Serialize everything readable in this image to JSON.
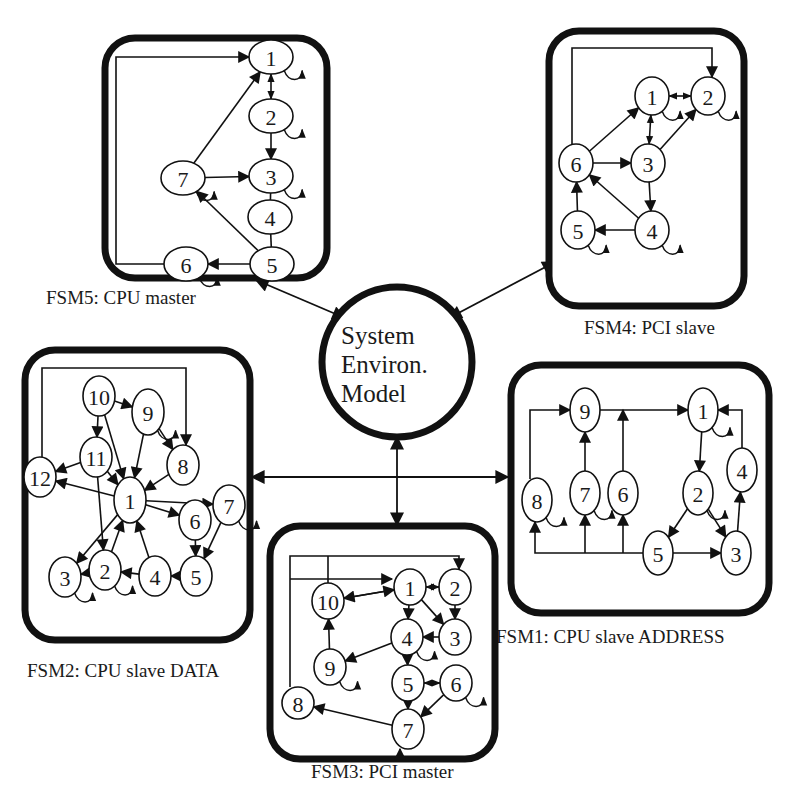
{
  "hub": {
    "lines": [
      "System",
      "Environ.",
      "Model"
    ],
    "cx": 397,
    "cy": 362,
    "r": 75
  },
  "colors": {
    "ink": "#111111",
    "background": "#ffffff"
  },
  "fsms": [
    {
      "id": "fsm5",
      "caption": "FSM5: CPU master",
      "box": {
        "x": 105,
        "y": 38,
        "w": 222,
        "h": 240,
        "r": 30
      },
      "caption_pos": {
        "x": 46,
        "y": 304
      },
      "nodes": [
        {
          "id": "1",
          "x": 271,
          "y": 57,
          "rx": 22,
          "ry": 17
        },
        {
          "id": "2",
          "x": 271,
          "y": 116,
          "rx": 22,
          "ry": 17
        },
        {
          "id": "3",
          "x": 271,
          "y": 176,
          "rx": 22,
          "ry": 17
        },
        {
          "id": "4",
          "x": 270,
          "y": 217,
          "rx": 22,
          "ry": 17
        },
        {
          "id": "5",
          "x": 272,
          "y": 264,
          "rx": 22,
          "ry": 17
        },
        {
          "id": "6",
          "x": 186,
          "y": 264,
          "rx": 22,
          "ry": 17
        },
        {
          "id": "7",
          "x": 183,
          "y": 178,
          "rx": 22,
          "ry": 17
        }
      ],
      "edges": [
        {
          "from": "7",
          "to": "1"
        },
        {
          "from": "7",
          "to": "3"
        },
        {
          "from": "5",
          "to": "7"
        },
        {
          "from": "5",
          "to": "6"
        },
        {
          "from": "2",
          "to": "3"
        },
        {
          "from": "1",
          "to": "2",
          "bidir": true
        },
        {
          "from": "3",
          "to": "4",
          "plain": true
        },
        {
          "from": "4",
          "to": "5",
          "plain": true
        }
      ],
      "loops": [
        "1",
        "2",
        "3",
        "6",
        "7"
      ],
      "polylines": [
        {
          "points": "164,264 116,264 116,57 249,57",
          "arrow": true
        }
      ]
    },
    {
      "id": "fsm4",
      "caption": "FSM4: PCI slave",
      "box": {
        "x": 549,
        "y": 31,
        "w": 195,
        "h": 275,
        "r": 30
      },
      "caption_pos": {
        "x": 584,
        "y": 334
      },
      "nodes": [
        {
          "id": "1",
          "x": 652,
          "y": 96,
          "rx": 17,
          "ry": 19
        },
        {
          "id": "2",
          "x": 708,
          "y": 96,
          "rx": 17,
          "ry": 19
        },
        {
          "id": "3",
          "x": 648,
          "y": 163,
          "rx": 17,
          "ry": 19
        },
        {
          "id": "4",
          "x": 652,
          "y": 230,
          "rx": 17,
          "ry": 19
        },
        {
          "id": "5",
          "x": 578,
          "y": 230,
          "rx": 17,
          "ry": 19
        },
        {
          "id": "6",
          "x": 576,
          "y": 163,
          "rx": 17,
          "ry": 19
        }
      ],
      "edges": [
        {
          "from": "6",
          "to": "1"
        },
        {
          "from": "6",
          "to": "3"
        },
        {
          "from": "3",
          "to": "2"
        },
        {
          "from": "3",
          "to": "4"
        },
        {
          "from": "4",
          "to": "6"
        },
        {
          "from": "4",
          "to": "5"
        },
        {
          "from": "5",
          "to": "6"
        },
        {
          "from": "1",
          "to": "2",
          "bidir": true
        },
        {
          "from": "1",
          "to": "3",
          "bidir": true
        }
      ],
      "loops": [
        "1",
        "2",
        "4",
        "5"
      ],
      "polylines": [
        {
          "points": "572,144 572,48 712,48 712,77",
          "arrow": true
        }
      ]
    },
    {
      "id": "fsm2",
      "caption": "FSM2: CPU slave DATA",
      "box": {
        "x": 25,
        "y": 350,
        "w": 225,
        "h": 290,
        "r": 30
      },
      "caption_pos": {
        "x": 27,
        "y": 677
      },
      "nodes": [
        {
          "id": "1",
          "x": 130,
          "y": 500,
          "rx": 16,
          "ry": 23
        },
        {
          "id": "2",
          "x": 105,
          "y": 570,
          "rx": 16,
          "ry": 20
        },
        {
          "id": "3",
          "x": 65,
          "y": 577,
          "rx": 16,
          "ry": 20
        },
        {
          "id": "4",
          "x": 155,
          "y": 576,
          "rx": 16,
          "ry": 20
        },
        {
          "id": "5",
          "x": 196,
          "y": 576,
          "rx": 16,
          "ry": 20
        },
        {
          "id": "6",
          "x": 195,
          "y": 520,
          "rx": 16,
          "ry": 20
        },
        {
          "id": "7",
          "x": 229,
          "y": 505,
          "rx": 16,
          "ry": 20
        },
        {
          "id": "8",
          "x": 183,
          "y": 465,
          "rx": 16,
          "ry": 20
        },
        {
          "id": "9",
          "x": 148,
          "y": 412,
          "rx": 16,
          "ry": 23
        },
        {
          "id": "10",
          "x": 99,
          "y": 396,
          "rx": 16,
          "ry": 20
        },
        {
          "id": "11",
          "x": 96,
          "y": 457,
          "rx": 16,
          "ry": 20
        },
        {
          "id": "12",
          "x": 40,
          "y": 477,
          "rx": 16,
          "ry": 20
        }
      ],
      "edges": [
        {
          "from": "10",
          "to": "9"
        },
        {
          "from": "10",
          "to": "11"
        },
        {
          "from": "10",
          "to": "1"
        },
        {
          "from": "9",
          "to": "8"
        },
        {
          "from": "9",
          "to": "1"
        },
        {
          "from": "8",
          "to": "1"
        },
        {
          "from": "11",
          "to": "12"
        },
        {
          "from": "11",
          "to": "1"
        },
        {
          "from": "11",
          "to": "2"
        },
        {
          "from": "1",
          "to": "12"
        },
        {
          "from": "1",
          "to": "7"
        },
        {
          "from": "1",
          "to": "6"
        },
        {
          "from": "1",
          "to": "3"
        },
        {
          "from": "2",
          "to": "1"
        },
        {
          "from": "4",
          "to": "1"
        },
        {
          "from": "6",
          "to": "5"
        },
        {
          "from": "7",
          "to": "5"
        },
        {
          "from": "5",
          "to": "4"
        },
        {
          "from": "4",
          "to": "2"
        },
        {
          "from": "2",
          "to": "3"
        }
      ],
      "loops": [
        "9",
        "7",
        "3",
        "2"
      ],
      "polylines": [
        {
          "points": "42,457 42,368 186,368 186,445",
          "arrow": true
        }
      ]
    },
    {
      "id": "fsm1",
      "caption": "FSM1: CPU slave ADDRESS",
      "box": {
        "x": 511,
        "y": 365,
        "w": 258,
        "h": 248,
        "r": 30
      },
      "caption_pos": {
        "x": 496,
        "y": 643
      },
      "nodes": [
        {
          "id": "1",
          "x": 703,
          "y": 410,
          "rx": 15,
          "ry": 22
        },
        {
          "id": "2",
          "x": 698,
          "y": 493,
          "rx": 15,
          "ry": 22
        },
        {
          "id": "3",
          "x": 736,
          "y": 553,
          "rx": 15,
          "ry": 22
        },
        {
          "id": "4",
          "x": 742,
          "y": 470,
          "rx": 15,
          "ry": 22
        },
        {
          "id": "5",
          "x": 658,
          "y": 553,
          "rx": 15,
          "ry": 22
        },
        {
          "id": "6",
          "x": 623,
          "y": 493,
          "rx": 15,
          "ry": 22
        },
        {
          "id": "7",
          "x": 585,
          "y": 493,
          "rx": 15,
          "ry": 22
        },
        {
          "id": "8",
          "x": 537,
          "y": 500,
          "rx": 15,
          "ry": 22
        },
        {
          "id": "9",
          "x": 585,
          "y": 410,
          "rx": 15,
          "ry": 22
        }
      ],
      "edges": [
        {
          "from": "9",
          "to": "1"
        },
        {
          "from": "1",
          "to": "2"
        },
        {
          "from": "2",
          "to": "5"
        },
        {
          "from": "2",
          "to": "3"
        },
        {
          "from": "5",
          "to": "3"
        },
        {
          "from": "3",
          "to": "4"
        },
        {
          "from": "7",
          "to": "9"
        }
      ],
      "loops": [
        "1",
        "2",
        "7",
        "8"
      ],
      "polylines": [
        {
          "points": "530,479 530,410 570,410",
          "arrow": true
        },
        {
          "points": "742,448 742,410 718,410",
          "arrow": true
        },
        {
          "points": "623,471 623,410",
          "arrow": true
        },
        {
          "points": "643,553 535,553 535,522",
          "arrow": true
        },
        {
          "points": "585,553 585,515",
          "arrow": true
        },
        {
          "points": "623,553 623,515",
          "arrow": true
        }
      ]
    },
    {
      "id": "fsm3",
      "caption": "FSM3: PCI master",
      "box": {
        "x": 270,
        "y": 526,
        "w": 225,
        "h": 233,
        "r": 30
      },
      "caption_pos": {
        "x": 311,
        "y": 778
      },
      "nodes": [
        {
          "id": "1",
          "x": 410,
          "y": 587,
          "rx": 16,
          "ry": 18
        },
        {
          "id": "2",
          "x": 455,
          "y": 587,
          "rx": 16,
          "ry": 18
        },
        {
          "id": "3",
          "x": 455,
          "y": 637,
          "rx": 16,
          "ry": 18
        },
        {
          "id": "4",
          "x": 407,
          "y": 637,
          "rx": 16,
          "ry": 18
        },
        {
          "id": "5",
          "x": 408,
          "y": 683,
          "rx": 16,
          "ry": 18
        },
        {
          "id": "6",
          "x": 456,
          "y": 683,
          "rx": 16,
          "ry": 18
        },
        {
          "id": "7",
          "x": 408,
          "y": 729,
          "rx": 16,
          "ry": 20
        },
        {
          "id": "8",
          "x": 298,
          "y": 703,
          "rx": 16,
          "ry": 16
        },
        {
          "id": "9",
          "x": 330,
          "y": 667,
          "rx": 16,
          "ry": 18
        },
        {
          "id": "10",
          "x": 328,
          "y": 601,
          "rx": 16,
          "ry": 18
        }
      ],
      "edges": [
        {
          "from": "10",
          "to": "1"
        },
        {
          "from": "1",
          "to": "10"
        },
        {
          "from": "1",
          "to": "4"
        },
        {
          "from": "1",
          "to": "3"
        },
        {
          "from": "2",
          "to": "3"
        },
        {
          "from": "3",
          "to": "4"
        },
        {
          "from": "4",
          "to": "9"
        },
        {
          "from": "9",
          "to": "10"
        },
        {
          "from": "4",
          "to": "5"
        },
        {
          "from": "5",
          "to": "7"
        },
        {
          "from": "6",
          "to": "7"
        },
        {
          "from": "7",
          "to": "8"
        },
        {
          "from": "1",
          "to": "2",
          "bidir": true
        },
        {
          "from": "5",
          "to": "6",
          "bidir": true
        }
      ],
      "loops": [
        "9",
        "6",
        "4"
      ],
      "polylines": [
        {
          "points": "290,687 290,556 459,556 459,569",
          "arrow": true
        },
        {
          "points": "290,579 392,579",
          "arrow": true
        },
        {
          "points": "328,556 328,583",
          "arrow": false
        },
        {
          "points": "400,759 400,749",
          "arrow": true
        }
      ]
    }
  ],
  "links": [
    {
      "from": "hub",
      "to": "fsm5",
      "x1": 345,
      "y1": 318,
      "x2": 256,
      "y2": 280
    },
    {
      "from": "hub",
      "to": "fsm4",
      "x1": 449,
      "y1": 318,
      "x2": 555,
      "y2": 262
    },
    {
      "from": "hub",
      "to": "fsm2_fsm1",
      "x1": 252,
      "y1": 477,
      "x2": 508,
      "y2": 477
    },
    {
      "from": "hub",
      "to": "fsm3",
      "x1": 397,
      "y1": 437,
      "x2": 397,
      "y2": 525
    }
  ]
}
